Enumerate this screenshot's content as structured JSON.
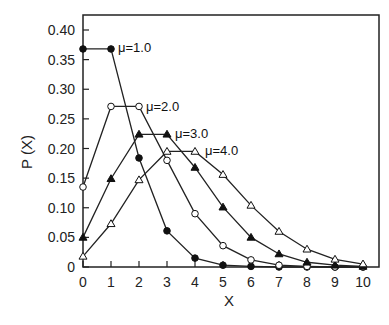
{
  "chart_data": {
    "type": "line",
    "title": "",
    "xlabel": "X",
    "ylabel": "P (X)",
    "xlim": [
      0,
      10
    ],
    "ylim": [
      0,
      0.4
    ],
    "grid": false,
    "legend_position": "inline labels",
    "x_ticks": [
      "0",
      "1",
      "2",
      "3",
      "4",
      "5",
      "6",
      "7",
      "8",
      "9",
      "10"
    ],
    "y_ticks": [
      "0",
      "0.05",
      "0.10",
      "0.15",
      "0.20",
      "0.25",
      "0.30",
      "0.35",
      "0.40"
    ],
    "x": [
      0,
      1,
      2,
      3,
      4,
      5,
      6,
      7,
      8,
      9,
      10
    ],
    "series": [
      {
        "name": "μ=1.0",
        "marker": "filled-circle",
        "values": [
          0.368,
          0.368,
          0.184,
          0.061,
          0.015,
          0.003,
          0.001,
          0.0,
          0.0,
          0.0,
          0.0
        ]
      },
      {
        "name": "μ=2.0",
        "marker": "open-circle",
        "values": [
          0.135,
          0.271,
          0.271,
          0.18,
          0.09,
          0.036,
          0.012,
          0.003,
          0.001,
          0.0,
          0.0
        ]
      },
      {
        "name": "μ=3.0",
        "marker": "filled-triangle",
        "values": [
          0.05,
          0.149,
          0.224,
          0.224,
          0.168,
          0.101,
          0.05,
          0.022,
          0.008,
          0.003,
          0.001
        ]
      },
      {
        "name": "μ=4.0",
        "marker": "open-triangle",
        "values": [
          0.018,
          0.073,
          0.147,
          0.195,
          0.195,
          0.156,
          0.104,
          0.06,
          0.03,
          0.013,
          0.005
        ]
      }
    ]
  },
  "labels": {
    "ylabel": "P (X)",
    "xlabel": "X",
    "mu1": "μ=1.0",
    "mu2": "μ=2.0",
    "mu3": "μ=3.0",
    "mu4": "μ=4.0"
  }
}
